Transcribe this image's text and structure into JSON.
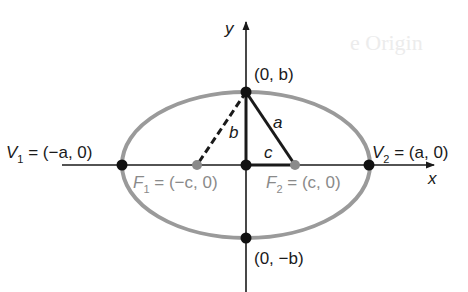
{
  "diagram": {
    "background_ghost_text": "e Origin",
    "axes": {
      "x_label": "x",
      "y_label": "y"
    },
    "points": {
      "top": {
        "text": "(0, b)"
      },
      "bottom": {
        "text": "(0, −b)"
      },
      "v1": {
        "name": "V",
        "sub": "1",
        "eq": " = (−a, 0)"
      },
      "v2": {
        "name": "V",
        "sub": "2",
        "eq": " = (a, 0)"
      },
      "f1": {
        "name": "F",
        "sub": "1",
        "eq": " = (−c, 0)"
      },
      "f2": {
        "name": "F",
        "sub": "2",
        "eq": " = (c, 0)"
      }
    },
    "segments": {
      "a": "a",
      "b": "b",
      "c": "c"
    },
    "colors": {
      "ellipse": "#9a9a9a",
      "axes": "#1a1a1a",
      "focus": "#8a8a8a",
      "vertex": "#111111"
    }
  }
}
